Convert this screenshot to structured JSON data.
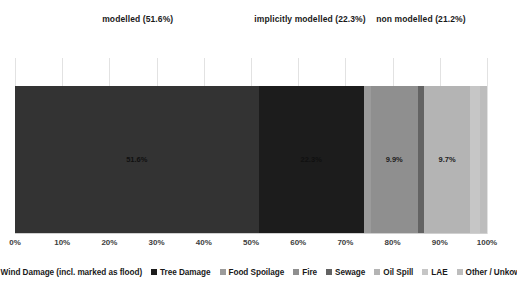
{
  "chart_data": {
    "type": "bar",
    "orientation": "horizontal-stacked",
    "title": "",
    "xlabel": "",
    "ylabel": "",
    "xlim": [
      0,
      100
    ],
    "grid": true,
    "legend_position": "bottom",
    "categories": [
      "Share of flood damage types"
    ],
    "tick_labels": [
      "0%",
      "10%",
      "20%",
      "30%",
      "40%",
      "50%",
      "60%",
      "70%",
      "80%",
      "90%",
      "100%"
    ],
    "tick_values": [
      0,
      10,
      20,
      30,
      40,
      50,
      60,
      70,
      80,
      90,
      100
    ],
    "series": [
      {
        "name": "Wind Damage (incl. marked as flood)",
        "value": 51.6,
        "label": "51.6%",
        "show_label": true,
        "color": "#333333"
      },
      {
        "name": "Tree Damage",
        "value": 22.3,
        "label": "22.3%",
        "show_label": true,
        "color": "#1c1c1c"
      },
      {
        "name": "Food Spoilage",
        "value": 1.5,
        "label": "",
        "show_label": false,
        "color": "#9b9b9b"
      },
      {
        "name": "Fire",
        "value": 9.9,
        "label": "9.9%",
        "show_label": true,
        "color": "#8f8f8f"
      },
      {
        "name": "Sewage",
        "value": 1.4,
        "label": "",
        "show_label": false,
        "color": "#636363"
      },
      {
        "name": "Oil Spill",
        "value": 9.7,
        "label": "9.7%",
        "show_label": true,
        "color": "#b4b4b4"
      },
      {
        "name": "LAE",
        "value": 2.1,
        "label": "",
        "show_label": false,
        "color": "#c6c6c6"
      },
      {
        "name": "Other / Unkown",
        "value": 1.5,
        "label": "",
        "show_label": false,
        "color": "#bdbdbd"
      }
    ],
    "annotations": [
      {
        "text": "modelled (51.6%)",
        "x_center_pct": 26.0,
        "value": 51.6
      },
      {
        "text": "implicitly modelled  (22.3%)",
        "x_center_pct": 62.5,
        "value": 22.3
      },
      {
        "text": "non modelled (21.2%)",
        "x_center_pct": 86.0,
        "value": 21.2
      }
    ]
  },
  "legend": {
    "items": [
      {
        "label": "Wind Damage (incl. marked as flood)",
        "color": "#333333"
      },
      {
        "label": "Tree Damage",
        "color": "#1c1c1c"
      },
      {
        "label": "Food Spoilage",
        "color": "#9b9b9b"
      },
      {
        "label": "Fire",
        "color": "#8f8f8f"
      },
      {
        "label": "Sewage",
        "color": "#636363"
      },
      {
        "label": "Oil Spill",
        "color": "#b4b4b4"
      },
      {
        "label": "LAE",
        "color": "#c6c6c6"
      },
      {
        "label": "Other / Unkown",
        "color": "#bdbdbd"
      }
    ]
  },
  "colors": {
    "background": "#ffffff",
    "gridline": "#e2e2e2",
    "axis": "#d0d0d0",
    "tick_text": "#3d3d3d",
    "annotation_text": "#1a1a1a"
  }
}
